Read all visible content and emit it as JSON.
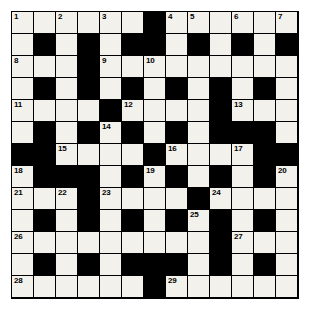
{
  "puzzle": {
    "type": "crossword-grid",
    "rows": 13,
    "cols": 13,
    "colors": {
      "white_cell": "#f2f1ec",
      "black_cell": "#000000",
      "grid_line": "#000000",
      "number_text": "#000000",
      "page_background": "#ffffff"
    },
    "grid": [
      [
        "W",
        "W",
        "W",
        "W",
        "W",
        "W",
        "B",
        "W",
        "W",
        "W",
        "W",
        "W",
        "W"
      ],
      [
        "W",
        "B",
        "W",
        "B",
        "W",
        "B",
        "B",
        "W",
        "B",
        "W",
        "B",
        "W",
        "B"
      ],
      [
        "W",
        "W",
        "W",
        "B",
        "W",
        "W",
        "W",
        "W",
        "W",
        "W",
        "W",
        "W",
        "W"
      ],
      [
        "W",
        "B",
        "W",
        "B",
        "W",
        "B",
        "W",
        "B",
        "W",
        "B",
        "W",
        "B",
        "W"
      ],
      [
        "W",
        "W",
        "W",
        "W",
        "B",
        "W",
        "W",
        "W",
        "W",
        "B",
        "W",
        "W",
        "W"
      ],
      [
        "W",
        "B",
        "W",
        "B",
        "W",
        "B",
        "W",
        "B",
        "W",
        "B",
        "B",
        "B",
        "W"
      ],
      [
        "B",
        "B",
        "W",
        "W",
        "W",
        "W",
        "B",
        "W",
        "W",
        "W",
        "W",
        "B",
        "B"
      ],
      [
        "W",
        "B",
        "B",
        "B",
        "W",
        "B",
        "W",
        "B",
        "W",
        "B",
        "W",
        "B",
        "W"
      ],
      [
        "W",
        "W",
        "W",
        "B",
        "W",
        "W",
        "W",
        "W",
        "B",
        "W",
        "W",
        "W",
        "W"
      ],
      [
        "W",
        "B",
        "W",
        "B",
        "W",
        "B",
        "W",
        "B",
        "W",
        "B",
        "W",
        "B",
        "W"
      ],
      [
        "W",
        "W",
        "W",
        "W",
        "W",
        "W",
        "W",
        "W",
        "W",
        "B",
        "W",
        "W",
        "W"
      ],
      [
        "W",
        "B",
        "W",
        "B",
        "W",
        "B",
        "B",
        "B",
        "W",
        "B",
        "W",
        "B",
        "W"
      ],
      [
        "W",
        "W",
        "W",
        "W",
        "W",
        "W",
        "B",
        "W",
        "W",
        "W",
        "W",
        "W",
        "W"
      ]
    ],
    "numbers": [
      {
        "row": 0,
        "col": 0,
        "label": "1"
      },
      {
        "row": 0,
        "col": 2,
        "label": "2"
      },
      {
        "row": 0,
        "col": 4,
        "label": "3"
      },
      {
        "row": 0,
        "col": 7,
        "label": "4"
      },
      {
        "row": 0,
        "col": 8,
        "label": "5"
      },
      {
        "row": 0,
        "col": 10,
        "label": "6"
      },
      {
        "row": 0,
        "col": 12,
        "label": "7"
      },
      {
        "row": 2,
        "col": 0,
        "label": "8"
      },
      {
        "row": 2,
        "col": 4,
        "label": "9"
      },
      {
        "row": 2,
        "col": 6,
        "label": "10"
      },
      {
        "row": 4,
        "col": 0,
        "label": "11"
      },
      {
        "row": 4,
        "col": 5,
        "label": "12"
      },
      {
        "row": 4,
        "col": 10,
        "label": "13"
      },
      {
        "row": 5,
        "col": 4,
        "label": "14"
      },
      {
        "row": 6,
        "col": 2,
        "label": "15"
      },
      {
        "row": 6,
        "col": 7,
        "label": "16"
      },
      {
        "row": 6,
        "col": 10,
        "label": "17"
      },
      {
        "row": 7,
        "col": 0,
        "label": "18"
      },
      {
        "row": 7,
        "col": 6,
        "label": "19"
      },
      {
        "row": 7,
        "col": 12,
        "label": "20"
      },
      {
        "row": 8,
        "col": 0,
        "label": "21"
      },
      {
        "row": 8,
        "col": 2,
        "label": "22"
      },
      {
        "row": 8,
        "col": 4,
        "label": "23"
      },
      {
        "row": 8,
        "col": 9,
        "label": "24"
      },
      {
        "row": 9,
        "col": 8,
        "label": "25"
      },
      {
        "row": 10,
        "col": 0,
        "label": "26"
      },
      {
        "row": 10,
        "col": 10,
        "label": "27"
      },
      {
        "row": 12,
        "col": 0,
        "label": "28"
      },
      {
        "row": 12,
        "col": 7,
        "label": "29"
      }
    ]
  }
}
